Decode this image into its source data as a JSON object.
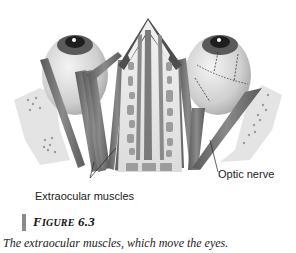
{
  "figure": {
    "labels": {
      "optic_nerve": "Optic nerve",
      "extraocular_muscles": "Extraocular muscles"
    },
    "title": {
      "first_letter": "F",
      "rest_smallcaps": "IGURE",
      "number": "6.3"
    },
    "caption": "The extraocular muscles, which move the eyes.",
    "colors": {
      "muscle": "#6e6e6e",
      "muscle_dark": "#4a4a4a",
      "bone": "#efefef",
      "eye": "#d8d8d8",
      "iris": "#3a3a3a",
      "accent_bar": "#8a8a8a"
    }
  }
}
